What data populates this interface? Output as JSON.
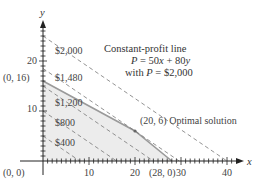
{
  "chart_data": {
    "type": "line",
    "title": "",
    "xlabel": "x",
    "ylabel": "y",
    "xlim": [
      0,
      42
    ],
    "ylim": [
      0,
      27
    ],
    "x_ticks": [
      10,
      20,
      30,
      40
    ],
    "y_ticks": [
      10,
      20
    ],
    "grid": false,
    "feasible_region": {
      "vertices": [
        [
          0,
          0
        ],
        [
          0,
          16
        ],
        [
          20,
          6
        ],
        [
          28,
          0
        ]
      ],
      "fill": "#ececec",
      "edge_color": "#999999"
    },
    "iso_profit_lines": [
      {
        "label": "$400",
        "P": 400,
        "x_intercept": 8,
        "y_intercept": 5
      },
      {
        "label": "$800",
        "P": 800,
        "x_intercept": 16,
        "y_intercept": 10
      },
      {
        "label": "$1,200",
        "P": 1200,
        "x_intercept": 24,
        "y_intercept": 15
      },
      {
        "label": "$1,480",
        "P": 1480,
        "x_intercept": 29.6,
        "y_intercept": 18.5
      },
      {
        "label": "$2,000",
        "P": 2000,
        "x_intercept": 40,
        "y_intercept": 25
      }
    ],
    "annotations": [
      {
        "text": "(0, 0)",
        "point": [
          0,
          0
        ]
      },
      {
        "text": "(0, 16)",
        "point": [
          0,
          16
        ]
      },
      {
        "text": "(20, 6) Optimal solution",
        "point": [
          20,
          6
        ]
      },
      {
        "text": "(28, 0)",
        "point": [
          28,
          0
        ]
      },
      {
        "text_lines": [
          "Constant-profit line",
          "P = 50x + 80y",
          "with P = $2,000"
        ]
      }
    ]
  },
  "labels": {
    "x_axis": "x",
    "y_axis": "y",
    "tick_10x": "10",
    "tick_20x": "20",
    "tick_30x": "30",
    "tick_40x": "40",
    "tick_10y": "10",
    "tick_20y": "20",
    "origin": "(0, 0)",
    "pt_0_16": "(0, 16)",
    "pt_20_6": "(20, 6) Optimal solution",
    "pt_28_0": "(28, 0)",
    "p400": "$400",
    "p800": "$800",
    "p1200": "$1,200",
    "p1480": "$1,480",
    "p2000": "$2,000",
    "caption_line1": "Constant-profit line",
    "caption_line2_a": "P",
    "caption_line2_b": " = 50",
    "caption_line2_c": "x",
    "caption_line2_d": " + 80",
    "caption_line2_e": "y",
    "caption_line3_a": "with ",
    "caption_line3_b": "P",
    "caption_line3_c": " = $2,000"
  }
}
